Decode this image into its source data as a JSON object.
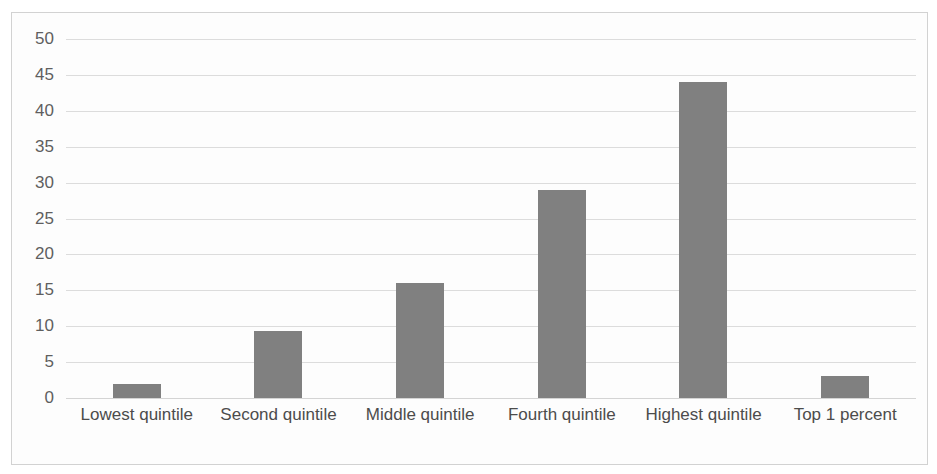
{
  "chart_data": {
    "type": "bar",
    "title": "",
    "subtitle": "",
    "xlabel": "",
    "ylabel": "",
    "categories": [
      "Lowest quintile",
      "Second quintile",
      "Middle quintile",
      "Fourth quintile",
      "Highest quintile",
      "Top 1 percent"
    ],
    "values": [
      1.9,
      9.4,
      16,
      29,
      44,
      3
    ],
    "ylim": [
      0,
      50
    ],
    "ytick_labels": [
      "0",
      "5",
      "10",
      "15",
      "20",
      "25",
      "30",
      "35",
      "40",
      "45",
      "50"
    ],
    "ytick_values": [
      0,
      5,
      10,
      15,
      20,
      25,
      30,
      35,
      40,
      45,
      50
    ],
    "grid": true,
    "grid_axis": "y",
    "legend": false,
    "legend_position": "none",
    "annotations": [],
    "colors": {
      "bar": "#808080",
      "gridline": "#dcdcdc",
      "baseline": "#d4d4d4",
      "border": "#d2d2d2",
      "plot_background": "#fdfdfd",
      "ytick_text": "#5f5f5f",
      "category_text": "#4c4c4c"
    }
  }
}
